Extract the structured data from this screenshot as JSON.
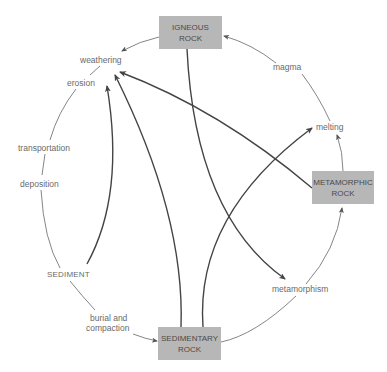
{
  "colors": {
    "box": "#b7b7b7",
    "box_text": "#4a4a4a",
    "label_text": "#6a6a6a",
    "line": "#555555"
  },
  "boxes": {
    "igneous": {
      "line1": "IGNEOUS",
      "line2": "ROCK"
    },
    "metamorphic": {
      "line1": "METAMORPHIC",
      "line2": "ROCK"
    },
    "sedimentary": {
      "line1": "SEDIMENTARY",
      "line2": "ROCK"
    }
  },
  "labels": {
    "weathering": "weathering",
    "erosion": "erosion",
    "transportation": "transportation",
    "deposition": "deposition",
    "sediment": "SEDIMENT",
    "burial_line1": "burial and",
    "burial_line2": "compaction",
    "magma": "magma",
    "melting": "melting",
    "metamorphism": "metamorphism"
  },
  "edges": [
    {
      "from": "igneous",
      "to": "weathering",
      "style": "thin"
    },
    {
      "from": "weathering",
      "to": "erosion",
      "style": "thin"
    },
    {
      "from": "erosion",
      "to": "transportation",
      "style": "thin"
    },
    {
      "from": "transportation",
      "to": "deposition",
      "style": "thin"
    },
    {
      "from": "deposition",
      "to": "sediment",
      "style": "thin"
    },
    {
      "from": "sediment",
      "to": "burial and compaction",
      "style": "thin"
    },
    {
      "from": "burial and compaction",
      "to": "sedimentary",
      "style": "thin"
    },
    {
      "from": "sedimentary",
      "to": "metamorphism",
      "style": "thin"
    },
    {
      "from": "metamorphism",
      "to": "metamorphic",
      "style": "thin"
    },
    {
      "from": "metamorphic",
      "to": "melting",
      "style": "thin"
    },
    {
      "from": "melting",
      "to": "magma",
      "style": "thin"
    },
    {
      "from": "magma",
      "to": "igneous",
      "style": "thin"
    },
    {
      "from": "sediment",
      "to": "erosion",
      "style": "thick"
    },
    {
      "from": "sedimentary",
      "to": "weathering",
      "style": "thick"
    },
    {
      "from": "sedimentary",
      "to": "melting",
      "style": "thick"
    },
    {
      "from": "igneous",
      "to": "metamorphism",
      "style": "thick"
    },
    {
      "from": "metamorphic",
      "to": "weathering",
      "style": "thick"
    }
  ]
}
